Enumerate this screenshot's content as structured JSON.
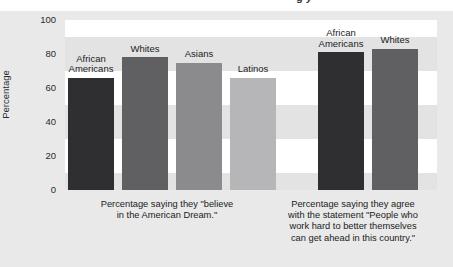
{
  "top_clipped_heading": "g    y",
  "axis": {
    "y_title": "Percentage",
    "y_ticks": [
      "100",
      "80",
      "60",
      "40",
      "20",
      "0"
    ]
  },
  "captions": {
    "left": "Percentage saying they \"believe\nin the American Dream.\"",
    "right": "Percentage saying they agree\nwith the statement \"People who\nwork hard to better themselves\ncan get ahead in this country.\""
  },
  "bars": [
    {
      "label": "African\nAmericans",
      "value": 66,
      "color": "#2f2f31",
      "group": 0
    },
    {
      "label": "Whites",
      "value": 78,
      "color": "#606062",
      "group": 0
    },
    {
      "label": "Asians",
      "value": 75,
      "color": "#8b8b8d",
      "group": 0
    },
    {
      "label": "Latinos",
      "value": 66,
      "color": "#b6b6b8",
      "group": 0
    },
    {
      "label": "African\nAmericans",
      "value": 81,
      "color": "#2f2f31",
      "group": 1
    },
    {
      "label": "Whites",
      "value": 83,
      "color": "#606062",
      "group": 1
    }
  ],
  "chart_data": {
    "type": "bar",
    "title": "",
    "xlabel": "",
    "ylabel": "Percentage",
    "ylim": [
      0,
      100
    ],
    "yticks": [
      0,
      20,
      40,
      60,
      80,
      100
    ],
    "grid": "horizontal alternating bands",
    "legend": "none (bars labeled directly)",
    "groups": [
      {
        "caption": "Percentage saying they \"believe in the American Dream.\"",
        "categories": [
          "African Americans",
          "Whites",
          "Asians",
          "Latinos"
        ],
        "values": [
          66,
          78,
          75,
          66
        ]
      },
      {
        "caption": "Percentage saying they agree with the statement \"People who work hard to better themselves can get ahead in this country.\"",
        "categories": [
          "African Americans",
          "Whites"
        ],
        "values": [
          81,
          83
        ]
      }
    ],
    "colors": [
      "#2f2f31",
      "#606062",
      "#8b8b8d",
      "#b6b6b8"
    ]
  }
}
